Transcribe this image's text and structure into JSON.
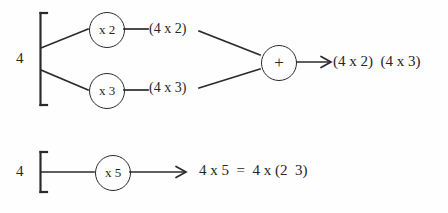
{
  "diagram": {
    "background_color": "#fefefe",
    "ink_color": "#262626",
    "rows": [
      {
        "id": "top",
        "operand": "4",
        "branches": [
          {
            "node_label": "x 2",
            "product_label": "(4 x 2)"
          },
          {
            "node_label": "x 3",
            "product_label": "(4 x 3)"
          }
        ],
        "combiner_label": "+",
        "result": "(4 x 2)  (4 x 3)"
      },
      {
        "id": "bottom",
        "operand": "4",
        "branches": [
          {
            "node_label": "x 5",
            "product_label": ""
          }
        ],
        "combiner_label": "",
        "result": "4 x 5  =  4 x (2  3)"
      }
    ]
  },
  "icons": {
    "arrowhead": "open-arrowhead",
    "bracket": "square-bracket"
  }
}
